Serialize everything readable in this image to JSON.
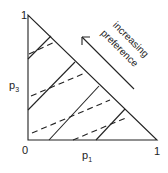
{
  "diagram": {
    "type": "probability-triangle-indifference-map",
    "axes": {
      "x_label": {
        "base": "p",
        "sub": "1"
      },
      "y_label": {
        "base": "p",
        "sub": "3"
      },
      "origin_label": "0",
      "x_max_label": "1",
      "y_max_label": "1"
    },
    "annotation": {
      "line1": "increasing",
      "line2": "preference"
    },
    "colors": {
      "stroke": "#222222",
      "background": "#ffffff"
    },
    "solid_lines": [
      {
        "x1": 28,
        "y1": 59,
        "x2": 51,
        "y2": 36
      },
      {
        "x1": 28,
        "y1": 110,
        "x2": 75,
        "y2": 62
      },
      {
        "x1": 49,
        "y1": 140,
        "x2": 99,
        "y2": 86
      },
      {
        "x1": 96,
        "y1": 140,
        "x2": 125,
        "y2": 109
      }
    ],
    "dashed_lines": [
      {
        "x1": 29,
        "y1": 54,
        "x2": 55,
        "y2": 42
      },
      {
        "x1": 31,
        "y1": 96,
        "x2": 85,
        "y2": 73
      },
      {
        "x1": 32,
        "y1": 133,
        "x2": 110,
        "y2": 100
      },
      {
        "x1": 73,
        "y1": 140,
        "x2": 128,
        "y2": 117
      }
    ]
  }
}
